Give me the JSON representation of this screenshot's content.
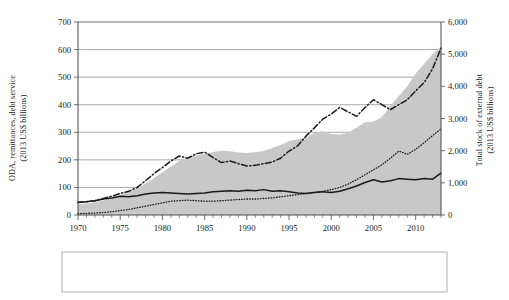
{
  "chart_data": {
    "type": "area",
    "title": "",
    "subtitle": "",
    "xlabel": "",
    "ylabel": "ODA, remittances, debt service (2013 US$ billions)",
    "ylabel_right": "Total stock of external debt (2013 US$ billions)",
    "xlim": [
      1970,
      2013
    ],
    "ylim": [
      0,
      700
    ],
    "ylim_right": [
      0,
      6000
    ],
    "grid": true,
    "legend_position": "bottom",
    "x_tick_labels": [
      "1970",
      "1975",
      "1980",
      "1985",
      "1990",
      "1995",
      "2000",
      "2005",
      "2010"
    ],
    "x_tick_values": [
      1970,
      1975,
      1980,
      1985,
      1990,
      1995,
      2000,
      2005,
      2010
    ],
    "x_minor_tick_interval": 1,
    "y_tick_labels": [
      "0",
      "100",
      "200",
      "300",
      "400",
      "500",
      "600",
      "700"
    ],
    "y_tick_values": [
      0,
      100,
      200,
      300,
      400,
      500,
      600,
      700
    ],
    "y_right_tick_labels": [
      "0",
      "1,000",
      "2,000",
      "3,000",
      "4,000",
      "5,000",
      "6,000"
    ],
    "y_right_tick_values": [
      0,
      1000,
      2000,
      3000,
      4000,
      5000,
      6000
    ],
    "x": [
      1970,
      1971,
      1972,
      1973,
      1974,
      1975,
      1976,
      1977,
      1978,
      1979,
      1980,
      1981,
      1982,
      1983,
      1984,
      1985,
      1986,
      1987,
      1988,
      1989,
      1990,
      1991,
      1992,
      1993,
      1994,
      1995,
      1996,
      1997,
      1998,
      1999,
      2000,
      2001,
      2002,
      2003,
      2004,
      2005,
      2006,
      2007,
      2008,
      2009,
      2010,
      2011,
      2012,
      2013
    ],
    "series": [
      {
        "name": "Stock of external debt of LMICs",
        "axis": "right",
        "style": "area",
        "color": "#c8c8c8",
        "values": [
          330,
          360,
          400,
          450,
          530,
          620,
          720,
          830,
          980,
          1150,
          1330,
          1500,
          1680,
          1810,
          1850,
          1900,
          1960,
          2000,
          1980,
          1940,
          1930,
          1950,
          1990,
          2080,
          2180,
          2300,
          2350,
          2400,
          2560,
          2600,
          2520,
          2500,
          2560,
          2720,
          2880,
          2900,
          3050,
          3400,
          3700,
          4000,
          4400,
          4700,
          5000,
          5250
        ]
      },
      {
        "name": "ODA disbursements to LMICs",
        "axis": "left",
        "style": "solid",
        "color": "#1a1a1a",
        "values": [
          46,
          48,
          52,
          58,
          62,
          68,
          66,
          70,
          76,
          80,
          82,
          80,
          78,
          76,
          78,
          80,
          84,
          86,
          88,
          86,
          90,
          88,
          92,
          86,
          88,
          84,
          80,
          78,
          82,
          84,
          82,
          86,
          95,
          105,
          118,
          128,
          120,
          124,
          132,
          130,
          128,
          132,
          130,
          152
        ]
      },
      {
        "name": "Remittances received by LMICs",
        "axis": "left",
        "style": "dotted",
        "color": "#1a1a1a",
        "values": [
          5,
          6,
          7,
          9,
          12,
          16,
          20,
          26,
          32,
          38,
          44,
          50,
          52,
          54,
          52,
          50,
          50,
          52,
          54,
          56,
          58,
          58,
          60,
          62,
          66,
          70,
          74,
          78,
          82,
          86,
          92,
          100,
          112,
          128,
          146,
          164,
          182,
          206,
          232,
          220,
          238,
          262,
          288,
          312
        ]
      },
      {
        "name": "Debt service paid by LMICs",
        "axis": "left",
        "style": "dash-dot",
        "color": "#1a1a1a",
        "values": [
          45,
          48,
          52,
          60,
          68,
          78,
          86,
          100,
          124,
          150,
          172,
          196,
          214,
          206,
          222,
          228,
          208,
          190,
          196,
          186,
          178,
          180,
          186,
          192,
          206,
          232,
          250,
          286,
          316,
          348,
          366,
          390,
          374,
          358,
          390,
          418,
          400,
          382,
          400,
          418,
          450,
          480,
          530,
          605
        ]
      }
    ]
  },
  "axes": {
    "left_title_line1": "ODA, remittances, debt service",
    "left_title_line2": "(2013 US$ billions)",
    "right_title_line1": "Total stock of external debt",
    "right_title_line2": "(2013 US$ billions)"
  },
  "legend": {
    "items": [
      {
        "label": "Stock of external debt of LMICs",
        "marker": "swatch"
      },
      {
        "label": "ODA disbursements to LMICs",
        "marker": "solid-line"
      },
      {
        "label": "Remittances received by LMICs",
        "marker": "dotted-line"
      },
      {
        "label": "Debt service paid by LMICs",
        "marker": "dash-dot-line"
      }
    ]
  },
  "colors": {
    "area_fill": "#c8c8c8",
    "line": "#1a1a1a",
    "grid": "#6f6f6f",
    "axis": "#4a4a4a"
  }
}
